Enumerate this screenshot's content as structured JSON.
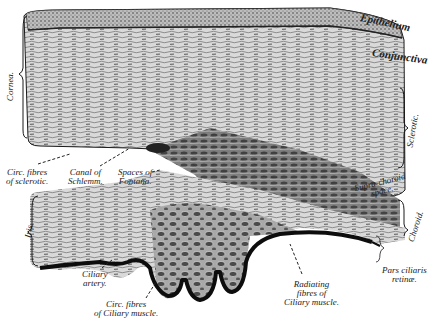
{
  "figure": {
    "colors": {
      "ink": "#1a1a1a",
      "paper": "#ffffff",
      "tissue_mid": "#8a8a8a",
      "tissue_light": "#c8c8c8"
    }
  },
  "labels": {
    "epithelium": "Epithelium",
    "conjunctiva": "Conjunctiva",
    "cornea": "Cornea.",
    "sclerotic": "Sclerotic.",
    "circ_fibres_sclerotic_1": "Circ. fibres",
    "circ_fibres_sclerotic_2": "of sclerotic.",
    "canal_schlemm_1": "Canal of",
    "canal_schlemm_2": "Schlemm.",
    "spaces_fontana_1": "Spaces of",
    "spaces_fontana_2": "Fontana.",
    "suprachoroid_1": "Supra-choroid",
    "suprachoroid_2": "space.",
    "iris": "Iris.",
    "choroid": "Choroid.",
    "ciliary_artery_1": "Ciliary",
    "ciliary_artery_2": "artery.",
    "circ_fibres_ciliary_1": "Circ. fibres",
    "circ_fibres_ciliary_2": "of Ciliary muscle.",
    "radiating_1": "Radiating",
    "radiating_2": "fibres of",
    "radiating_3": "Ciliary muscle.",
    "pars_ciliaris_1": "Pars ciliaris",
    "pars_ciliaris_2": "retinæ."
  }
}
